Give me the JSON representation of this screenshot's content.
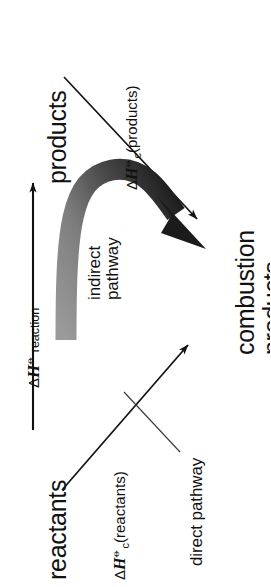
{
  "figure": {
    "background_color": "#ffffff",
    "orientation": "rotated-90-ccw",
    "ink_color": "#111111",
    "arrow_gradient_light": "#8f8f8f",
    "arrow_gradient_dark": "#1a1a1a"
  },
  "nodes": {
    "products": "products",
    "reactants": "reactants",
    "combustion_products_line1": "combustion",
    "combustion_products_line2": "products"
  },
  "labels": {
    "delta_h_reaction": {
      "delta": "Δ",
      "symbol": "H",
      "superscript": "⦵",
      "subscript": "",
      "trailing": " reaction"
    },
    "delta_hc_products": {
      "delta": "Δ",
      "symbol": "H",
      "superscript": "⦵",
      "subscript": "c",
      "trailing": "(products)"
    },
    "delta_hc_reactants": {
      "delta": "Δ",
      "symbol": "H",
      "superscript": "⦵",
      "subscript": "c",
      "trailing": "(reactants)"
    },
    "indirect_pathway_line1": "indirect",
    "indirect_pathway_line2": "pathway",
    "direct_pathway": "direct pathway"
  }
}
